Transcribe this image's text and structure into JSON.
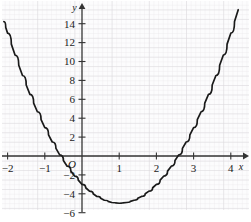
{
  "chart_data": {
    "type": "line",
    "title": "",
    "subtitle": "",
    "xlabel": "x",
    "ylabel": "y",
    "curve_label": "y = 2x^2 - 4x - 3",
    "xlim": [
      -2.35,
      4.45
    ],
    "ylim": [
      -6.6,
      15.4
    ],
    "x_ticks": [
      -2,
      -1,
      1,
      2,
      3,
      4
    ],
    "x_tick_labels": [
      "−2",
      "−1",
      "1",
      "2",
      "3",
      "4"
    ],
    "y_ticks": [
      -6,
      -4,
      -2,
      2,
      4,
      6,
      8,
      10,
      12,
      14
    ],
    "y_tick_labels": [
      "−6",
      "−4",
      "−2",
      "2",
      "4",
      "6",
      "8",
      "10",
      "12",
      "14"
    ],
    "origin_label": "O",
    "grid": true,
    "grid_minor_step": 0.2,
    "grid_major_step": 1,
    "legend": "none",
    "vertex": [
      1,
      -5
    ],
    "roots": [
      -0.58,
      2.58
    ],
    "y_intercept": -3,
    "x": [
      -2.1,
      -2.0,
      -1.8,
      -1.6,
      -1.4,
      -1.2,
      -1.0,
      -0.8,
      -0.6,
      -0.4,
      -0.2,
      0.0,
      0.2,
      0.4,
      0.6,
      0.8,
      1.0,
      1.2,
      1.4,
      1.6,
      1.8,
      2.0,
      2.2,
      2.4,
      2.6,
      2.8,
      3.0,
      3.2,
      3.4,
      3.6,
      3.8,
      4.0,
      4.2
    ],
    "y": [
      14.22,
      13.0,
      10.68,
      8.52,
      6.52,
      4.68,
      3.0,
      1.48,
      0.12,
      -1.08,
      -2.12,
      -3.0,
      -3.72,
      -4.28,
      -4.68,
      -4.92,
      -5.0,
      -4.92,
      -4.68,
      -4.28,
      -3.72,
      -3.0,
      -2.12,
      -1.08,
      0.12,
      1.48,
      3.0,
      4.68,
      6.52,
      8.52,
      10.68,
      13.0,
      15.48
    ]
  },
  "style": {
    "curve_color": "#1a1a1a",
    "axis_color": "#333333",
    "grid_minor_color": "#e8e6e9",
    "grid_major_color": "#d6d3d9",
    "background_color": "#ffffff",
    "plot_background_color": "#fcfcfd",
    "text_color": "#1a1a1a"
  },
  "geometry": {
    "plot_left": 2,
    "plot_top": 2,
    "plot_right": 249,
    "plot_bottom": 210,
    "x_axis_y": 156,
    "y_axis_x": 82,
    "px_per_unit_x": 37.2,
    "px_per_unit_y": 9.45
  }
}
